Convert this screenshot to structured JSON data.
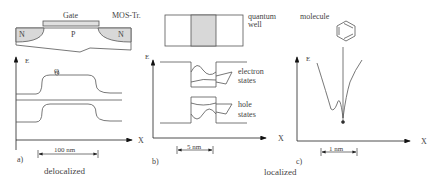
{
  "panel_a": {
    "label": "a)",
    "gate_label": "Gate",
    "device_label": "MOS-Tr.",
    "region_left": "N",
    "region_middle": "P",
    "region_right": "N",
    "axis_y": "E",
    "axis_x": "X",
    "q_label": "Q",
    "scale_label": "100 nm",
    "caption": "delocalized"
  },
  "panel_b": {
    "label": "b)",
    "structure_label_line1": "quantum",
    "structure_label_line2": "well",
    "axis_y": "E",
    "axis_x": "X",
    "electron_label_line1": "electron",
    "electron_label_line2": "states",
    "hole_label_line1": "hole",
    "hole_label_line2": "states",
    "scale_label": "5 nm"
  },
  "panel_c": {
    "label": "c)",
    "structure_label": "molecule",
    "axis_y": "E",
    "axis_x": "X",
    "scale_label": "1 nm",
    "caption": "localized"
  },
  "colors": {
    "line": "#555555",
    "shade": "#d8d8d8",
    "arrow": "#111111"
  }
}
